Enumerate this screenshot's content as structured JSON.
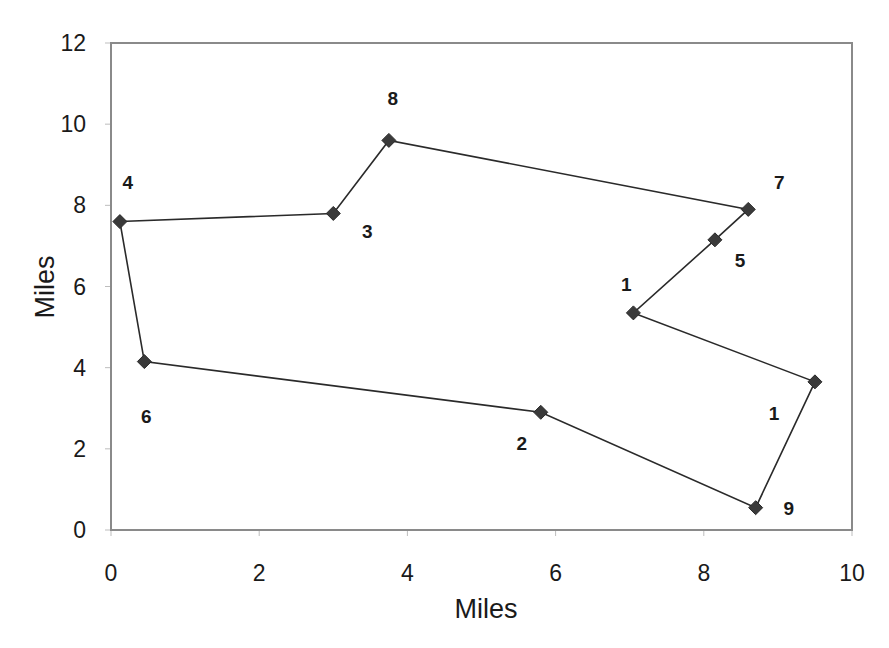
{
  "chart_data": {
    "type": "scatter",
    "title": "",
    "xlabel": "Miles",
    "ylabel": "Miles",
    "xlim": [
      0,
      10
    ],
    "ylim": [
      0,
      12
    ],
    "x_ticks": [
      0,
      2,
      4,
      6,
      8,
      10
    ],
    "y_ticks": [
      0,
      2,
      4,
      6,
      8,
      10,
      12
    ],
    "grid": false,
    "legend": null,
    "connected": true,
    "closed_loop": true,
    "marker": "diamond",
    "colors": {
      "line": "#2a2a2a",
      "marker": "#3a3a3a",
      "frame": "#8a8a8a",
      "text": "#1a1a1a"
    },
    "points": [
      {
        "label": "4",
        "x": 0.12,
        "y": 7.6
      },
      {
        "label": "3",
        "x": 3.0,
        "y": 7.8
      },
      {
        "label": "8",
        "x": 3.75,
        "y": 9.6
      },
      {
        "label": "7",
        "x": 8.6,
        "y": 7.9
      },
      {
        "label": "5",
        "x": 8.15,
        "y": 7.15
      },
      {
        "label": "1",
        "x": 7.05,
        "y": 5.35
      },
      {
        "label": "1",
        "x": 9.5,
        "y": 3.65
      },
      {
        "label": "9",
        "x": 8.7,
        "y": 0.55
      },
      {
        "label": "2",
        "x": 5.8,
        "y": 2.9
      },
      {
        "label": "6",
        "x": 0.45,
        "y": 4.15
      }
    ],
    "label_offsets": [
      [
        8,
        -40
      ],
      [
        34,
        18
      ],
      [
        4,
        -42
      ],
      [
        31,
        -27
      ],
      [
        25,
        20
      ],
      [
        -7,
        -29
      ],
      [
        -41,
        31
      ],
      [
        33,
        0
      ],
      [
        -19,
        31
      ],
      [
        2,
        54
      ]
    ]
  }
}
